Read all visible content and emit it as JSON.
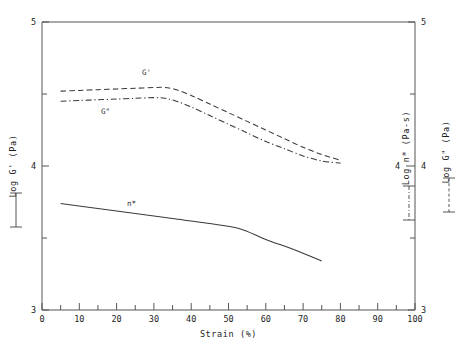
{
  "chart_data": {
    "type": "line",
    "title": "",
    "xlabel": "Strain (%)",
    "ylabel": "Log G' (Pa)",
    "xlim": [
      0,
      100
    ],
    "ylim": [
      3,
      5
    ],
    "grid": false,
    "legend_position": "inline-annotations",
    "x_ticks": [
      "0",
      "10",
      "20",
      "30",
      "40",
      "50",
      "60",
      "70",
      "80",
      "90",
      "100"
    ],
    "x_tick_values": [
      0,
      10,
      20,
      30,
      40,
      50,
      60,
      70,
      80,
      90,
      100
    ],
    "x_minor_step": 5,
    "y_ticks": [
      "3",
      "4",
      "5"
    ],
    "y_tick_values": [
      3,
      4,
      5
    ],
    "y_minor_values": [
      3.5,
      4.5
    ],
    "axes": {
      "left": {
        "label": "Log G'  (Pa)",
        "line_style": "solid",
        "ticks": [
          "3",
          "4",
          "5"
        ]
      },
      "right_inner": {
        "label": "Log n*  (Pa-s)",
        "line_style": "dashdot",
        "ticks": [
          "4"
        ]
      },
      "right_outer": {
        "label": "Log G\"  (Pa)",
        "line_style": "dashed",
        "ticks": [
          "3",
          "4",
          "5"
        ]
      }
    },
    "series": [
      {
        "name": "G'",
        "label": "G'",
        "line_style": "dashed",
        "color": "#3a3a3a",
        "x": [
          5,
          10,
          15,
          20,
          25,
          30,
          33,
          36,
          40,
          45,
          50,
          55,
          60,
          65,
          70,
          75,
          80
        ],
        "y": [
          4.52,
          4.525,
          4.53,
          4.535,
          4.54,
          4.545,
          4.545,
          4.53,
          4.49,
          4.43,
          4.37,
          4.31,
          4.25,
          4.19,
          4.13,
          4.08,
          4.04
        ]
      },
      {
        "name": "G''",
        "label": "G\"",
        "line_style": "dashdot",
        "color": "#3a3a3a",
        "x": [
          5,
          10,
          15,
          20,
          25,
          30,
          33,
          36,
          40,
          45,
          50,
          55,
          60,
          65,
          70,
          75,
          80
        ],
        "y": [
          4.45,
          4.455,
          4.46,
          4.465,
          4.47,
          4.475,
          4.47,
          4.45,
          4.41,
          4.35,
          4.29,
          4.23,
          4.17,
          4.12,
          4.07,
          4.035,
          4.02
        ]
      },
      {
        "name": "n*",
        "label": "n*",
        "line_style": "solid",
        "color": "#3a3a3a",
        "x": [
          5,
          15,
          25,
          35,
          45,
          53,
          60,
          68,
          75
        ],
        "y": [
          3.74,
          3.705,
          3.67,
          3.635,
          3.6,
          3.565,
          3.49,
          3.415,
          3.34
        ]
      }
    ],
    "annotations": [
      {
        "text": "G'",
        "x": 28,
        "y": 4.63
      },
      {
        "text": "G\"",
        "x": 17,
        "y": 4.36
      },
      {
        "text": "n*",
        "x": 24,
        "y": 3.72
      }
    ]
  }
}
